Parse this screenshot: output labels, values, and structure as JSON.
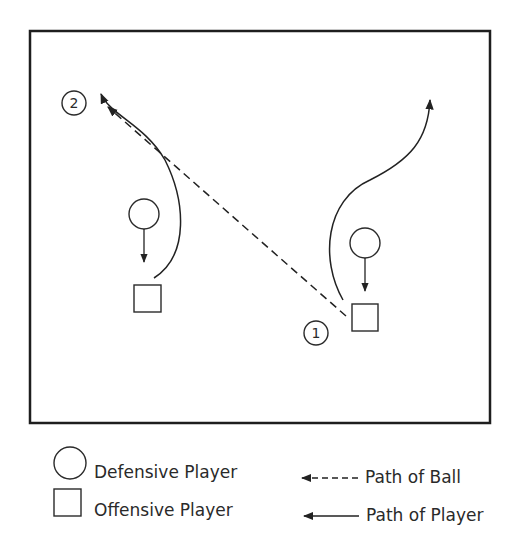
{
  "diagram": {
    "court": {
      "stroke": "#1e1e1e"
    },
    "markers": [
      {
        "id": "marker-2",
        "label": "2"
      },
      {
        "id": "marker-1",
        "label": "1"
      }
    ]
  },
  "legend": {
    "defensive_player": "Defensive Player",
    "offensive_player": "Offensive Player",
    "path_of_ball": "Path of Ball",
    "path_of_player": "Path of Player"
  }
}
